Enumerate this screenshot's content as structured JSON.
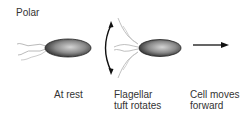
{
  "title": "Polar",
  "labels": {
    "rest": "At rest",
    "rotate_line1": "Flagellar",
    "rotate_line2": "tuft rotates",
    "move_line1": "Cell moves",
    "move_line2": "forward"
  },
  "colors": {
    "cell_dark": "#2a2a2a",
    "cell_light": "#bdbdbd",
    "flagella": "#9a9a9a",
    "arrow": "#111111"
  }
}
